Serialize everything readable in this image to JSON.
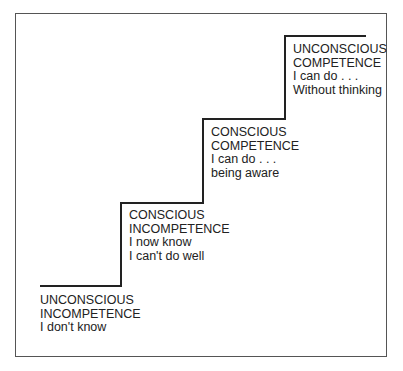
{
  "diagram": {
    "type": "staircase",
    "steps": [
      {
        "title_line1": "UNCONSCIOUS",
        "title_line2": "INCOMPETENCE",
        "desc_line1": "I don't know",
        "desc_line2": ""
      },
      {
        "title_line1": "CONSCIOUS",
        "title_line2": "INCOMPETENCE",
        "desc_line1": "I now know",
        "desc_line2": "I can't do well"
      },
      {
        "title_line1": "CONSCIOUS",
        "title_line2": "COMPETENCE",
        "desc_line1": "I can do . . .",
        "desc_line2": "being aware"
      },
      {
        "title_line1": "UNCONSCIOUS",
        "title_line2": "COMPETENCE",
        "desc_line1": "I can do . . .",
        "desc_line2": "Without thinking"
      }
    ],
    "colors": {
      "line": "#222222",
      "frame": "#555555",
      "text": "#222222"
    }
  }
}
